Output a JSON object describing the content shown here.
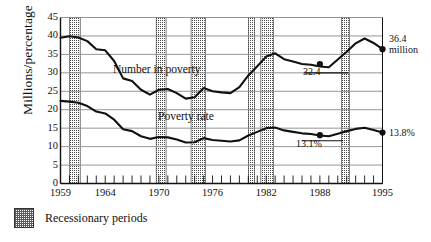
{
  "chart_data": {
    "type": "line",
    "title": "",
    "subtitle": "",
    "xlabel": "",
    "ylabel": "Millions/percentage",
    "xlim": [
      1959,
      1995
    ],
    "ylim": [
      0,
      45
    ],
    "ytick_step": 5,
    "grid": true,
    "legend_position": "below-plot-left",
    "x_tick_labels": [
      "1959",
      "1964",
      "1970",
      "1976",
      "1982",
      "1988",
      "1995"
    ],
    "x_tick_values": [
      1959,
      1964,
      1970,
      1976,
      1982,
      1988,
      1995
    ],
    "y_tick_labels": [
      "0",
      "5",
      "10",
      "15",
      "20",
      "25",
      "30",
      "35",
      "40",
      "45"
    ],
    "y_tick_values": [
      0,
      5,
      10,
      15,
      20,
      25,
      30,
      35,
      40,
      45
    ],
    "x": [
      1959,
      1960,
      1961,
      1962,
      1963,
      1964,
      1965,
      1966,
      1967,
      1968,
      1969,
      1970,
      1971,
      1972,
      1973,
      1974,
      1975,
      1976,
      1977,
      1978,
      1979,
      1980,
      1981,
      1982,
      1983,
      1984,
      1985,
      1986,
      1987,
      1988,
      1989,
      1990,
      1991,
      1992,
      1993,
      1994,
      1995
    ],
    "series": [
      {
        "name": "Number in poverty",
        "unit": "millions",
        "color": "#111111",
        "values": [
          39.5,
          39.9,
          39.6,
          38.6,
          36.4,
          36.1,
          33.2,
          28.5,
          27.8,
          25.4,
          24.1,
          25.4,
          25.6,
          24.5,
          23.0,
          23.4,
          25.9,
          25.0,
          24.7,
          24.5,
          26.1,
          29.3,
          31.8,
          34.4,
          35.3,
          33.7,
          33.1,
          32.4,
          32.2,
          31.7,
          31.5,
          33.6,
          35.7,
          38.0,
          39.3,
          38.1,
          36.4
        ]
      },
      {
        "name": "Poverty rate",
        "unit": "percent",
        "color": "#111111",
        "values": [
          22.4,
          22.2,
          21.9,
          21.0,
          19.5,
          19.0,
          17.3,
          14.7,
          14.2,
          12.8,
          12.1,
          12.6,
          12.5,
          11.9,
          11.1,
          11.2,
          12.3,
          11.8,
          11.6,
          11.4,
          11.7,
          13.0,
          14.0,
          15.0,
          15.2,
          14.4,
          14.0,
          13.6,
          13.4,
          13.0,
          12.8,
          13.5,
          14.2,
          14.8,
          15.1,
          14.5,
          13.8
        ]
      }
    ],
    "annotations": [
      {
        "name": "series-label-number-in-poverty",
        "text": "Number in poverty"
      },
      {
        "name": "series-label-poverty-rate",
        "text": "Poverty rate"
      },
      {
        "name": "value-label-32-4",
        "text": "32.4",
        "x": 1988,
        "y": 32.4
      },
      {
        "name": "value-label-36-4-million-line1",
        "text": "36.4",
        "x": 1995,
        "y": 36.4
      },
      {
        "name": "value-label-36-4-million-line2",
        "text": "million",
        "x": 1995,
        "y": 36.4
      },
      {
        "name": "value-label-13-1-percent",
        "text": "13.1%",
        "x": 1988,
        "y": 13.1
      },
      {
        "name": "value-label-13-8-percent",
        "text": "13.8%",
        "x": 1995,
        "y": 13.8
      }
    ],
    "markers": [
      {
        "name": "marker-number-1988",
        "x": 1988,
        "y": 32.4
      },
      {
        "name": "marker-number-1995",
        "x": 1995,
        "y": 36.4
      },
      {
        "name": "marker-rate-1988",
        "x": 1988,
        "y": 13.1
      },
      {
        "name": "marker-rate-1995",
        "x": 1995,
        "y": 13.8
      }
    ],
    "recession_bands": [
      {
        "start": 1960.0,
        "end": 1961.2
      },
      {
        "start": 1969.7,
        "end": 1970.8
      },
      {
        "start": 1973.6,
        "end": 1975.2
      },
      {
        "start": 1980.0,
        "end": 1980.7
      },
      {
        "start": 1981.4,
        "end": 1982.8
      },
      {
        "start": 1990.4,
        "end": 1991.3
      }
    ]
  },
  "legend": {
    "swatch_name": "recession-band-swatch",
    "label": "Recessionary periods"
  },
  "colors": {
    "line": "#111111",
    "grid": "#8a8a8a",
    "axis": "#111111",
    "recession": "#6a6a6a",
    "background": "#ffffff"
  }
}
